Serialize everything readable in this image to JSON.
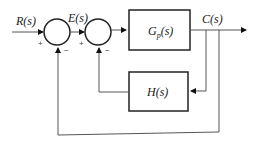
{
  "diagram": {
    "type": "block-diagram",
    "signals": {
      "input": "R(s)",
      "error": "E(s)",
      "output": "C(s)"
    },
    "blocks": {
      "plant": {
        "label": "G",
        "subscript": "p",
        "suffix": "(s)"
      },
      "feedback": {
        "label": "H(s)"
      }
    },
    "summing_junctions": [
      {
        "id": "sum1",
        "signs": {
          "left": "+",
          "bottom": "−"
        }
      },
      {
        "id": "sum2",
        "signs": {
          "left": "+",
          "bottom": "−"
        }
      }
    ],
    "colors": {
      "line": "#555555",
      "block_border": "#222222",
      "background": "#ffffff"
    }
  }
}
